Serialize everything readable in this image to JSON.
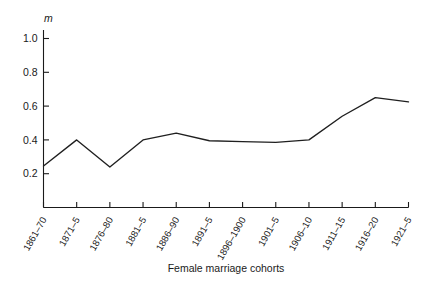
{
  "chart_data": {
    "type": "line",
    "title": "",
    "subtitle": "",
    "xlabel": "Female marriage cohorts",
    "ylabel": "m",
    "categories": [
      "1861–70",
      "1871–5",
      "1876–80",
      "1881–5",
      "1886–90",
      "1891–5",
      "1896–1900",
      "1901–5",
      "1906–10",
      "1911–15",
      "1916–20",
      "1921–5"
    ],
    "values": [
      0.245,
      0.4,
      0.24,
      0.4,
      0.44,
      0.395,
      0.39,
      0.385,
      0.4,
      0.54,
      0.65,
      0.625
    ],
    "series": [
      {
        "name": "m",
        "values": [
          0.245,
          0.4,
          0.24,
          0.4,
          0.44,
          0.395,
          0.39,
          0.385,
          0.4,
          0.54,
          0.65,
          0.625
        ]
      }
    ],
    "ylim": [
      0.0,
      1.06
    ],
    "yticks": [
      0.2,
      0.4,
      0.6,
      0.8,
      1.0
    ],
    "ytick_labels": [
      "0.2",
      "0.4",
      "0.6",
      "0.8",
      "1.0"
    ],
    "grid": false,
    "legend": "none",
    "xtick_label_rotation_deg": -60,
    "line_color": "#1f1f1f",
    "axis_color": "#1a1a1a",
    "background_color": "#ffffff"
  },
  "axes": {
    "y_axis_name": "m",
    "x_axis_title": "Female marriage cohorts"
  }
}
